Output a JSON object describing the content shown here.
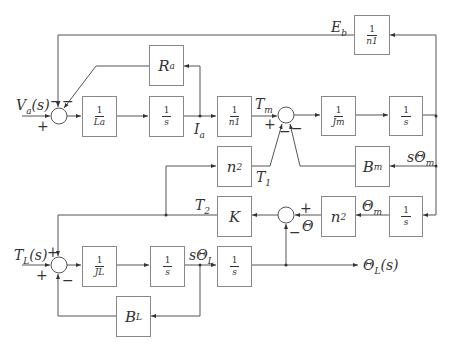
{
  "blocks": {
    "inv_n1_top": {
      "num": "1",
      "den": "n1"
    },
    "inv_La": {
      "num": "1",
      "den": "La"
    },
    "integrator_1": {
      "num": "1",
      "den": "s"
    },
    "Ra": {
      "label": "R",
      "sub": "a"
    },
    "inv_n1_mid": {
      "num": "1",
      "den": "n1"
    },
    "inv_Jm": {
      "num": "1",
      "den": "Jm"
    },
    "integrator_2": {
      "num": "1",
      "den": "s"
    },
    "n2_upper": {
      "label": "n",
      "sub": "2"
    },
    "Bm": {
      "label": "B",
      "sub": "m"
    },
    "K": {
      "label": "K"
    },
    "n2_lower": {
      "label": "n",
      "sub": "2"
    },
    "integrator_3": {
      "num": "1",
      "den": "s"
    },
    "inv_JL": {
      "num": "1",
      "den": "JL"
    },
    "integrator_4": {
      "num": "1",
      "den": "s"
    },
    "integrator_5": {
      "num": "1",
      "den": "s"
    },
    "BL": {
      "label": "B",
      "sub": "L"
    }
  },
  "signals": {
    "Eb": {
      "base": "E",
      "sub": "b"
    },
    "Va": {
      "text": "V",
      "sub": "a",
      "tail": "(s)"
    },
    "Ia": {
      "base": "I",
      "sub": "a"
    },
    "Tm": {
      "base": "T",
      "sub": "m"
    },
    "T1": {
      "base": "T",
      "sub": "1"
    },
    "T2": {
      "base": "T",
      "sub": "2"
    },
    "sThetaM": {
      "base": "sΘ",
      "sub": "m"
    },
    "ThetaM": {
      "base": "Θ",
      "sub": "m"
    },
    "Theta": {
      "base": "Θ"
    },
    "TL": {
      "text": "T",
      "sub": "L",
      "tail": "(s)"
    },
    "sThetaL": {
      "base": "sΘ",
      "sub": "L"
    },
    "ThetaL_out": {
      "text": "Θ",
      "sub": "L",
      "tail": "(s)"
    }
  },
  "signs": {
    "sum1_plus": "+",
    "sum1_minus_a": "−",
    "sum1_minus_b": "−",
    "sum2_plus": "+",
    "sum2_minus_a": "−",
    "sum2_minus_b": "−",
    "sum3_plus": "+",
    "sum3_minus": "−",
    "sum4_plus_top": "+",
    "sum4_plus_left": "+",
    "sum4_minus": "−"
  },
  "colors": {
    "line": "#555555",
    "box_border": "#888888",
    "text": "#333333"
  }
}
